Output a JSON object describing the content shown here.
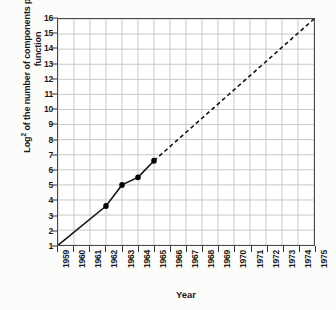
{
  "chart_data": {
    "type": "line",
    "title": "",
    "xlabel": "Year",
    "ylabel_line1": "Log² of the number of components",
    "ylabel_line2": "per integrated function",
    "ylabel_base": "Log",
    "ylabel_exponent": "2",
    "ylabel_rest": " of the number of components per integrated function",
    "xlim": [
      1959,
      1975
    ],
    "ylim": [
      1,
      16
    ],
    "grid": true,
    "legend": "none",
    "xticks": [
      "1959",
      "1960",
      "1961",
      "1962",
      "1963",
      "1964",
      "1965",
      "1966",
      "1967",
      "1968",
      "1969",
      "1970",
      "1971",
      "1972",
      "1973",
      "1974",
      "1975"
    ],
    "yticks": [
      "1",
      "2",
      "3",
      "4",
      "5",
      "6",
      "7",
      "8",
      "9",
      "10",
      "11",
      "12",
      "13",
      "14",
      "15",
      "16"
    ],
    "series": [
      {
        "name": "observed",
        "style": "solid",
        "markers": true,
        "x": [
          1959,
          1962,
          1963,
          1964,
          1965
        ],
        "y": [
          1,
          3.6,
          5.0,
          5.5,
          6.6
        ]
      },
      {
        "name": "extrapolated",
        "style": "dashed",
        "markers": false,
        "x": [
          1965,
          1975
        ],
        "y": [
          6.6,
          16
        ]
      }
    ],
    "colors": {
      "line": "#141414",
      "marker": "#000000",
      "grid": "#c8c8c8",
      "axis": "#4a4a4a",
      "plot_background": "#ffffff",
      "page_background": "#fcfcfb",
      "text": "#1a1a1a"
    }
  }
}
